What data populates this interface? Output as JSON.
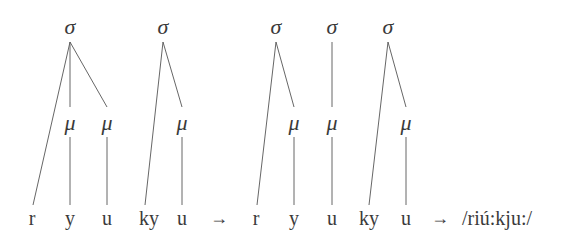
{
  "diagram": {
    "left": {
      "sigmas": [
        {
          "label": "σ",
          "x": 70,
          "y": 28
        },
        {
          "label": "σ",
          "x": 163,
          "y": 28
        }
      ],
      "moras": [
        {
          "label": "μ",
          "x": 70,
          "y": 125
        },
        {
          "label": "μ",
          "x": 107,
          "y": 125
        },
        {
          "label": "μ",
          "x": 182,
          "y": 125
        }
      ],
      "segments": [
        {
          "label": "r",
          "x": 32
        },
        {
          "label": "y",
          "x": 70
        },
        {
          "label": "u",
          "x": 107
        },
        {
          "label": "ky",
          "x": 150
        },
        {
          "label": "u",
          "x": 182
        }
      ]
    },
    "arrow1": {
      "label": "→",
      "x": 219
    },
    "right": {
      "sigmas": [
        {
          "label": "σ",
          "x": 276,
          "y": 28
        },
        {
          "label": "σ",
          "x": 332,
          "y": 28
        },
        {
          "label": "σ",
          "x": 388,
          "y": 28
        }
      ],
      "moras": [
        {
          "label": "μ",
          "x": 294,
          "y": 125
        },
        {
          "label": "μ",
          "x": 332,
          "y": 125
        },
        {
          "label": "μ",
          "x": 406,
          "y": 125
        }
      ],
      "segments": [
        {
          "label": "r",
          "x": 256
        },
        {
          "label": "y",
          "x": 294
        },
        {
          "label": "u",
          "x": 332
        },
        {
          "label": "ky",
          "x": 370
        },
        {
          "label": "u",
          "x": 406
        }
      ]
    },
    "arrow2": {
      "label": "→",
      "x": 440
    },
    "result": {
      "label": "/riú:kju:/",
      "x": 462
    }
  }
}
